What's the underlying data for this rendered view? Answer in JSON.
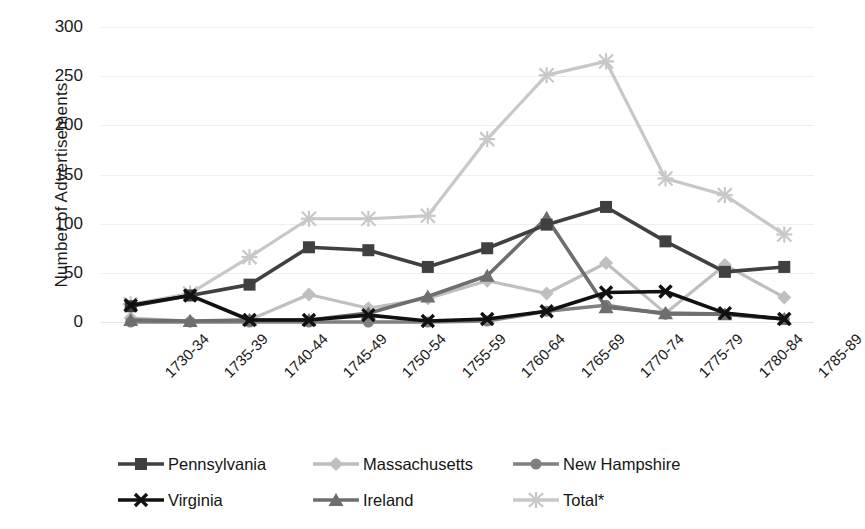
{
  "chart_data": {
    "type": "line",
    "title": "",
    "xlabel": "",
    "ylabel": "Number of Advertisements",
    "ylim": [
      0,
      300
    ],
    "yticks": [
      0,
      50,
      100,
      150,
      200,
      250,
      300
    ],
    "grid": true,
    "legend_position": "bottom",
    "categories": [
      "1730-34",
      "1735-39",
      "1740-44",
      "1745-49",
      "1750-54",
      "1755-59",
      "1760-64",
      "1765-69",
      "1770-74",
      "1775-79",
      "1780-84",
      "1785-89"
    ],
    "series": [
      {
        "name": "Pennsylvania",
        "marker": "square",
        "color": "#404040",
        "values": [
          16,
          27,
          38,
          76,
          73,
          56,
          75,
          99,
          117,
          82,
          51,
          56
        ]
      },
      {
        "name": "Massachusetts",
        "marker": "diamond",
        "color": "#BFBFBF",
        "values": [
          4,
          1,
          2,
          28,
          14,
          24,
          42,
          29,
          60,
          9,
          58,
          25
        ]
      },
      {
        "name": "New Hampshire",
        "marker": "circle",
        "color": "#808080",
        "values": [
          0,
          0,
          0,
          0,
          0,
          0,
          1,
          11,
          17,
          8,
          8,
          3
        ]
      },
      {
        "name": "Virginia",
        "marker": "x",
        "color": "#111111",
        "values": [
          17,
          27,
          2,
          2,
          7,
          1,
          3,
          11,
          30,
          31,
          9,
          3
        ]
      },
      {
        "name": "Ireland",
        "marker": "triangle",
        "color": "#6E6E6E",
        "values": [
          2,
          1,
          2,
          2,
          9,
          26,
          47,
          106,
          15,
          9,
          8,
          3
        ]
      },
      {
        "name": "Total*",
        "marker": "asterisk",
        "color": "#C8C8C8",
        "values": [
          18,
          29,
          66,
          105,
          105,
          108,
          186,
          251,
          265,
          146,
          129,
          89
        ]
      }
    ]
  },
  "axis": {
    "y_title": "Number of Advertisements",
    "y_tick_labels": [
      "300",
      "250",
      "200",
      "150",
      "100",
      "50",
      "0"
    ]
  },
  "legend": {
    "items": [
      {
        "label": "Pennsylvania",
        "marker": "square-marker",
        "color": "#404040"
      },
      {
        "label": "Massachusetts",
        "marker": "diamond-marker",
        "color": "#BFBFBF"
      },
      {
        "label": "New Hampshire",
        "marker": "circle-marker",
        "color": "#808080"
      },
      {
        "label": "Virginia",
        "marker": "x-marker",
        "color": "#111111"
      },
      {
        "label": "Ireland",
        "marker": "triangle-marker",
        "color": "#6E6E6E"
      },
      {
        "label": "Total*",
        "marker": "asterisk-marker",
        "color": "#C8C8C8"
      }
    ]
  }
}
